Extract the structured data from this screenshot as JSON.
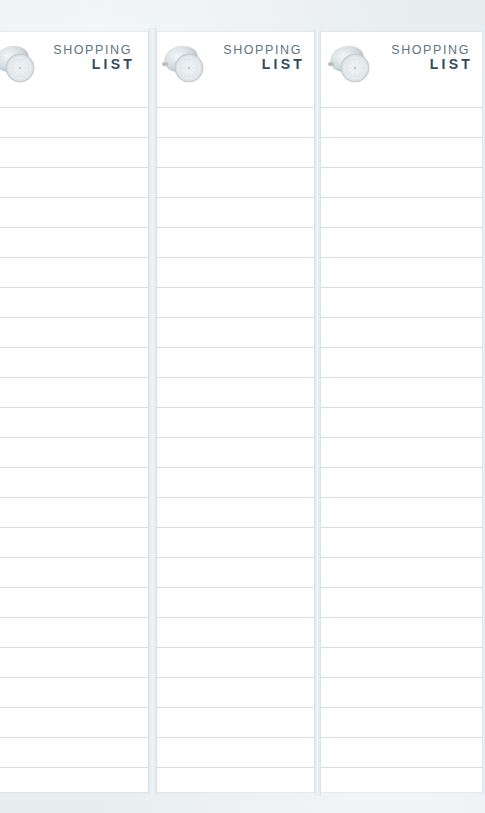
{
  "document": {
    "type": "shopping-list-notepad-sheets",
    "sheet_count": 3,
    "background_color": "#e8edf0",
    "paper_color": "#ffffff",
    "rule_color": "#d8dde0"
  },
  "sheets": [
    {
      "title_top": "SHOPPING",
      "title_bottom": "LIST",
      "icon": "lemon-icon",
      "ruled_lines": 23
    },
    {
      "title_top": "SHOPPING",
      "title_bottom": "LIST",
      "icon": "lemon-icon",
      "ruled_lines": 23
    },
    {
      "title_top": "SHOPPING",
      "title_bottom": "LIST",
      "icon": "lemon-icon",
      "ruled_lines": 23
    }
  ],
  "colors": {
    "title_top": "#5f7480",
    "title_bottom": "#2f4c58",
    "lemon_tint": "#c9d3d8"
  }
}
